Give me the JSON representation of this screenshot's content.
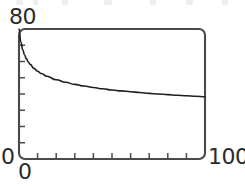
{
  "figure": {
    "background_color": "#ffffff",
    "ink_color": "#2b2b2b",
    "frame_color": "#4a4a4a",
    "curve_color": "#1f1f1f"
  },
  "labels": {
    "y_max": "80",
    "y_min": "0",
    "x_min": "0",
    "x_max": "100"
  },
  "chart_data": {
    "type": "line",
    "title": "",
    "subtitle": "",
    "xlabel": "",
    "ylabel": "",
    "xlim": [
      0,
      100
    ],
    "ylim": [
      0,
      80
    ],
    "grid": false,
    "legend": false,
    "legend_position": "none",
    "frame": "box-rounded",
    "x_tick_labels": [
      "0",
      "100"
    ],
    "y_tick_labels": [
      "0",
      "80"
    ],
    "x_ticks_major": [
      0,
      100
    ],
    "x_ticks_minor": [
      10,
      20,
      30,
      40,
      50,
      60,
      70,
      80,
      90
    ],
    "y_ticks_major": [
      0,
      80
    ],
    "y_ticks_minor": [
      10,
      20,
      30,
      40,
      50,
      60,
      70
    ],
    "tick_direction": "inward",
    "annotations": [],
    "series": [
      {
        "name": "decay-curve",
        "color": "#1f1f1f",
        "line_width": 1.6,
        "x": [
          0,
          1,
          2,
          3,
          4,
          5,
          6,
          8,
          10,
          12,
          15,
          20,
          25,
          30,
          35,
          40,
          45,
          50,
          55,
          60,
          65,
          70,
          75,
          80,
          85,
          90,
          95,
          100
        ],
        "values": [
          80.0,
          72.0,
          67.2,
          64.0,
          61.6,
          59.7,
          58.2,
          55.8,
          54.0,
          52.6,
          50.9,
          48.8,
          47.2,
          45.9,
          44.9,
          44.0,
          43.2,
          42.5,
          41.9,
          41.4,
          40.9,
          40.4,
          40.0,
          39.6,
          39.2,
          38.9,
          38.6,
          38.3
        ]
      }
    ]
  }
}
